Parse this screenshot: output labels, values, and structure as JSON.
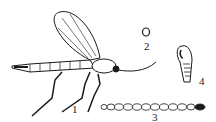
{
  "figure": {
    "labels": {
      "adult": "1",
      "egg": "2",
      "larva": "3",
      "pupa": "4"
    },
    "colors": {
      "ink": "#1a1a1a",
      "background": "#ffffff"
    }
  }
}
